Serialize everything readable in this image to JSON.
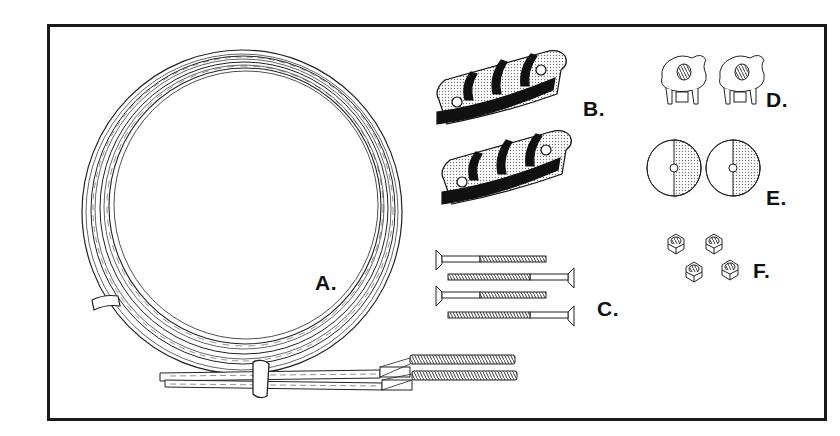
{
  "diagram": {
    "title": "",
    "parts": [
      {
        "id": "A",
        "label": "A.",
        "description": "coiled wire cable with tie bands and threaded end fittings"
      },
      {
        "id": "B",
        "label": "B.",
        "description": "two cable clamp brackets"
      },
      {
        "id": "C",
        "label": "C.",
        "description": "four flat-head wood screws"
      },
      {
        "id": "D",
        "label": "D.",
        "description": "two pronged tee nuts"
      },
      {
        "id": "E",
        "label": "E.",
        "description": "two flat washers"
      },
      {
        "id": "F",
        "label": "F.",
        "description": "four hex nuts"
      }
    ],
    "colors": {
      "ink": "#111111",
      "paper": "#ffffff",
      "shade": "#bdbdbd"
    }
  }
}
